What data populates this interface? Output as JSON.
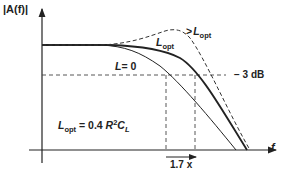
{
  "figure": {
    "y_axis_label": "|A(f)|",
    "x_axis_label": "f",
    "minus3db_label": "− 3 dB",
    "bandwidth_ratio_label": "1.7 x",
    "equation": {
      "lhs_main": "L",
      "lhs_sub": "opt",
      "equals": " = 0.4 ",
      "r": "R",
      "r_sup": "2",
      "c": "C",
      "c_sub": "L"
    },
    "curves": [
      {
        "name": "L = 0",
        "label_main": "L",
        "label_rest": "= 0",
        "style": "solid-thin"
      },
      {
        "name": "L_opt",
        "label_main": "L",
        "label_sub": "opt",
        "style": "solid-thick"
      },
      {
        "name": "> L_opt",
        "label_prefix": ">",
        "label_main": "L",
        "label_sub": "opt",
        "style": "dashed"
      }
    ],
    "colors": {
      "line": "#222222",
      "background": "#ffffff"
    }
  }
}
